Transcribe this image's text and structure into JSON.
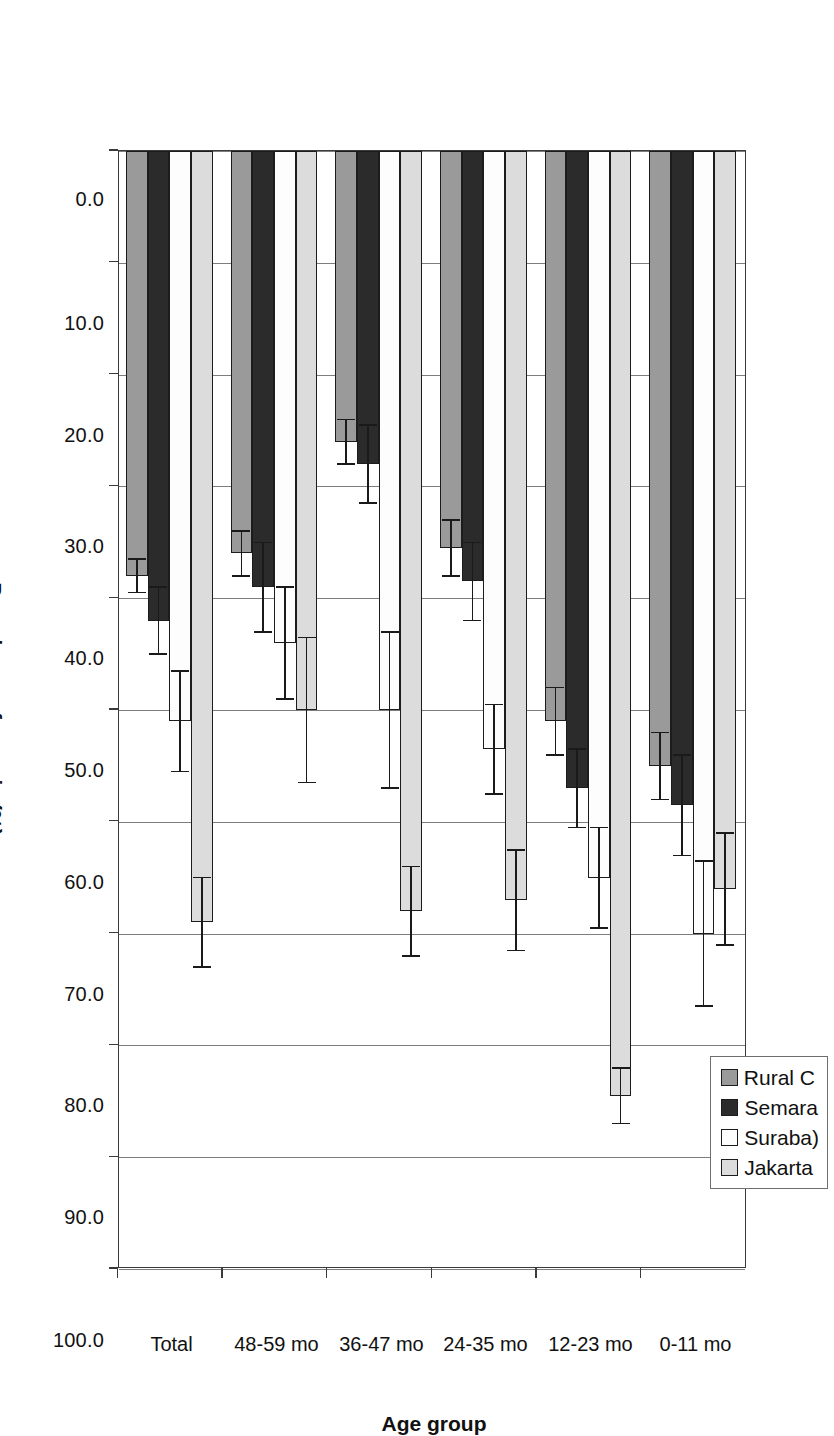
{
  "figure": {
    "axis_title_x": "Age group",
    "axis_title_y": "Prevalence of anemia (%)"
  },
  "legend": {
    "position": "top-right",
    "items": [
      {
        "label": "Rural C",
        "color": "#9a9a9a",
        "swatch": "sw-rural"
      },
      {
        "label": "Semara",
        "color": "#2b2b2b",
        "swatch": "sw-semarang"
      },
      {
        "label": "Suraba)",
        "color": "#fdfdfd",
        "swatch": "sw-surabaya"
      },
      {
        "label": "Jakarta",
        "color": "#dcdcdc",
        "swatch": "sw-jakarta"
      }
    ]
  },
  "chart_data": {
    "type": "bar",
    "orientation": "vertical-rendered-rotated",
    "title": "",
    "xlabel": "Age group",
    "ylabel": "Prevalence of anemia (%)",
    "ylim": [
      0,
      100
    ],
    "ytick_labels": [
      "0.0",
      "10.0",
      "20.0",
      "30.0",
      "40.0",
      "50.0",
      "60.0",
      "70.0",
      "80.0",
      "90.0",
      "100.0"
    ],
    "ytick_values": [
      0,
      10,
      20,
      30,
      40,
      50,
      60,
      70,
      80,
      90,
      100
    ],
    "grid": true,
    "legend_position": "top-right",
    "categories": [
      "0-11 mo",
      "12-23 mo",
      "24-35 mo",
      "36-47 mo",
      "48-59 mo",
      "Total"
    ],
    "series": [
      {
        "name": "Jakarta",
        "color": "#dcdcdc",
        "values": [
          66.0,
          84.5,
          67.0,
          68.0,
          50.0,
          69.0
        ],
        "errors": [
          5.0,
          2.5,
          4.5,
          4.0,
          6.5,
          4.0
        ]
      },
      {
        "name": "Surabaya",
        "color": "#fdfdfd",
        "values": [
          70.0,
          65.0,
          53.5,
          50.0,
          44.0,
          51.0
        ],
        "errors": [
          6.5,
          4.5,
          4.0,
          7.0,
          5.0,
          4.5
        ]
      },
      {
        "name": "Semarang",
        "color": "#2b2b2b",
        "values": [
          58.5,
          57.0,
          38.5,
          28.0,
          39.0,
          42.0
        ],
        "errors": [
          4.5,
          3.5,
          3.5,
          3.5,
          4.0,
          3.0
        ]
      },
      {
        "name": "Rural C",
        "color": "#9a9a9a",
        "values": [
          55.0,
          51.0,
          35.5,
          26.0,
          36.0,
          38.0
        ],
        "errors": [
          3.0,
          3.0,
          2.5,
          2.0,
          2.0,
          1.5
        ]
      }
    ]
  }
}
